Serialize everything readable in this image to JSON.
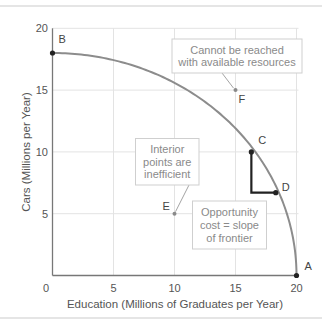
{
  "chart_data": {
    "type": "line",
    "title": "",
    "xlabel": "Education (Millions of Graduates per Year)",
    "ylabel": "Cars (Millions per Year)",
    "xlim": [
      0,
      20
    ],
    "ylim": [
      0,
      20
    ],
    "x_ticks": [
      0,
      5,
      10,
      15,
      20
    ],
    "y_ticks": [
      5,
      10,
      15,
      20
    ],
    "x_tick_labels": [
      "0",
      "5",
      "10",
      "15",
      "20"
    ],
    "y_tick_labels": [
      "5",
      "10",
      "15",
      "20"
    ],
    "grid": true,
    "series": [
      {
        "name": "Production possibilities frontier",
        "x": [
          0,
          2,
          4,
          6,
          8,
          10,
          12,
          14,
          16,
          16.3,
          18,
          18.3,
          19,
          20
        ],
        "y": [
          18,
          17.9,
          17.6,
          17.2,
          16.5,
          15.6,
          14.4,
          12.9,
          10.8,
          10,
          7.8,
          6.7,
          5.6,
          0
        ]
      }
    ],
    "points": [
      {
        "label": "A",
        "x": 20,
        "y": 0,
        "on_frontier": true
      },
      {
        "label": "B",
        "x": 0,
        "y": 18,
        "on_frontier": true
      },
      {
        "label": "C",
        "x": 16.3,
        "y": 10,
        "on_frontier": true
      },
      {
        "label": "D",
        "x": 18.3,
        "y": 6.7,
        "on_frontier": true
      },
      {
        "label": "E",
        "x": 10,
        "y": 5,
        "on_frontier": false
      },
      {
        "label": "F",
        "x": 15,
        "y": 15,
        "on_frontier": false
      }
    ],
    "annotations": [
      {
        "text": [
          "Cannot be reached",
          "with available resources"
        ],
        "points_to": "F"
      },
      {
        "text": [
          "Interior",
          "points are",
          "inefficient"
        ],
        "points_to": "E"
      },
      {
        "text": [
          "Opportunity",
          "cost = slope",
          "of frontier"
        ],
        "points_to": "C-D slope triangle"
      }
    ],
    "colors": {
      "frontier": "#8c8c8c",
      "triangle": "#222222",
      "grid": "#e3e3e3",
      "axis": "#777777",
      "note_text": "#8a8a8a",
      "note_border": "#cfcfcf"
    }
  }
}
